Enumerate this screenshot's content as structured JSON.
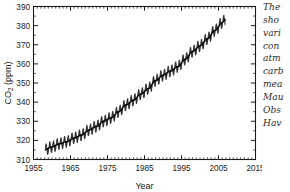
{
  "chart_data": {
    "type": "line",
    "title": "",
    "xlabel": "Year",
    "ylabel": "CO2 (ppm)",
    "ylabel_parts": {
      "base": "CO",
      "sub": "2",
      "unit": " (ppm)"
    },
    "xlim": [
      1955,
      2015
    ],
    "ylim": [
      310,
      390
    ],
    "xticks": [
      1955,
      1965,
      1975,
      1985,
      1995,
      2005,
      2015
    ],
    "xtick_labels": [
      "1955",
      "1965",
      "1975",
      "1985",
      "1995",
      "2005",
      "2015"
    ],
    "yticks": [
      310,
      320,
      330,
      340,
      350,
      360,
      370,
      380,
      390
    ],
    "ytick_labels": [
      "310",
      "320",
      "330",
      "340",
      "350",
      "360",
      "370",
      "380",
      "390"
    ],
    "x_minor_interval": 1,
    "y_minor_interval": 5,
    "grid": false,
    "legend": null,
    "tick_direction": "in",
    "frame": "box",
    "series": [
      {
        "name": "Monthly mean CO2 (seasonal cycle)",
        "style": "oscillating-thin",
        "color": "#1a1a1a",
        "seasonal_amplitude_ppm": 3.0,
        "x_start": 1958.2,
        "x_end": 2006.8
      },
      {
        "name": "Smoothed trend",
        "style": "thick-line",
        "color": "#000000",
        "x": [
          1958,
          1960,
          1962,
          1964,
          1966,
          1968,
          1970,
          1972,
          1974,
          1976,
          1978,
          1980,
          1982,
          1984,
          1986,
          1988,
          1990,
          1992,
          1994,
          1996,
          1998,
          2000,
          2002,
          2004,
          2006
        ],
        "values": [
          315.0,
          316.6,
          318.2,
          319.3,
          321.2,
          322.8,
          325.4,
          327.3,
          330.0,
          331.8,
          335.0,
          338.5,
          341.0,
          344.2,
          347.0,
          351.3,
          354.0,
          356.2,
          358.5,
          362.4,
          366.5,
          369.4,
          373.1,
          377.4,
          381.5
        ]
      }
    ]
  },
  "caption": {
    "lines": [
      "The",
      "sho",
      "vari",
      "con",
      "atm",
      "carb",
      "mea",
      "Mau",
      "Obs",
      "Hav"
    ],
    "full_text_clipped": true
  },
  "colors": {
    "axis": "#1a1a1a",
    "data": "#1a1a1a",
    "trend": "#000000",
    "text": "#1a1a1a",
    "caption": "#2b2b2b",
    "background": "#ffffff"
  }
}
